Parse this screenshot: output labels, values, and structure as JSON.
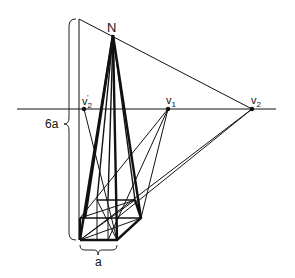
{
  "diagram": {
    "title": "",
    "labels": {
      "apex": "N",
      "vp_prime": "v",
      "vp_prime_sub": "2",
      "vp_prime_mark": "'",
      "vp1": "v",
      "vp1_sub": "1",
      "vp2": "v",
      "vp2_sub": "2",
      "height": "6a",
      "base_width": "a"
    },
    "colors": {
      "ink": "#111111",
      "background": "#ffffff"
    }
  }
}
